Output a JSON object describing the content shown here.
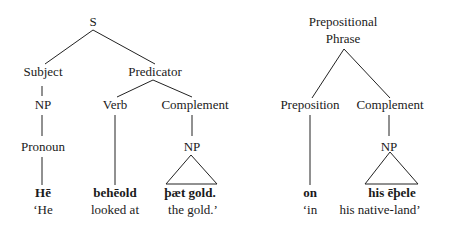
{
  "tree1": {
    "root": "S",
    "subject": "Subject",
    "predicator": "Predicator",
    "np1": "NP",
    "verb": "Verb",
    "complement": "Complement",
    "pronoun": "Pronoun",
    "np2": "NP",
    "words": [
      {
        "oe": "Hē",
        "gloss": "‘He"
      },
      {
        "oe": "behēold",
        "gloss": "looked at"
      },
      {
        "oe": "þæt gold.",
        "gloss": "the gold.’"
      }
    ]
  },
  "tree2": {
    "root_line1": "Prepositional",
    "root_line2": "Phrase",
    "preposition": "Preposition",
    "complement": "Complement",
    "np": "NP",
    "words": [
      {
        "oe": "on",
        "gloss": "‘in"
      },
      {
        "oe": "his ēþele",
        "gloss": "his native-land’"
      }
    ]
  }
}
